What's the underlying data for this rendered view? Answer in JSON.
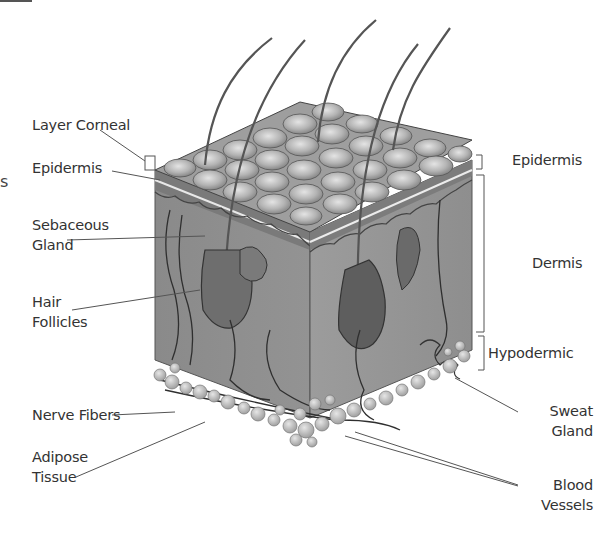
{
  "figure": {
    "colors": {
      "background": "#ffffff",
      "left_face": "#8c8c8c",
      "right_face": "#9a9a9a",
      "top_surface": "#a8a8a8",
      "cell_highlight": "#d8d8d8",
      "outline": "#3a3a3a",
      "fat": "#c4c4c4",
      "label_text": "#333333"
    }
  },
  "stray_glyph": "s",
  "labels_left": [
    {
      "id": "layer-corneal",
      "text": "Layer Corneal"
    },
    {
      "id": "epidermis",
      "text": "Epidermis"
    },
    {
      "id": "sebaceous-gland",
      "line1": "Sebaceous",
      "line2": "Gland"
    },
    {
      "id": "hair-follicles",
      "line1": "Hair",
      "line2": "Follicles"
    },
    {
      "id": "nerve-fibers",
      "text": "Nerve Fibers"
    },
    {
      "id": "adipose-tissue",
      "line1": "Adipose",
      "line2": "Tissue"
    }
  ],
  "labels_right": [
    {
      "id": "epidermis",
      "text": "Epidermis"
    },
    {
      "id": "dermis",
      "text": "Dermis"
    },
    {
      "id": "hypodermic",
      "text": "Hypodermic"
    },
    {
      "id": "sweat-gland",
      "line1": "Sweat",
      "line2": "Gland"
    },
    {
      "id": "blood-vessels",
      "line1": "Blood",
      "line2": "Vessels"
    }
  ]
}
